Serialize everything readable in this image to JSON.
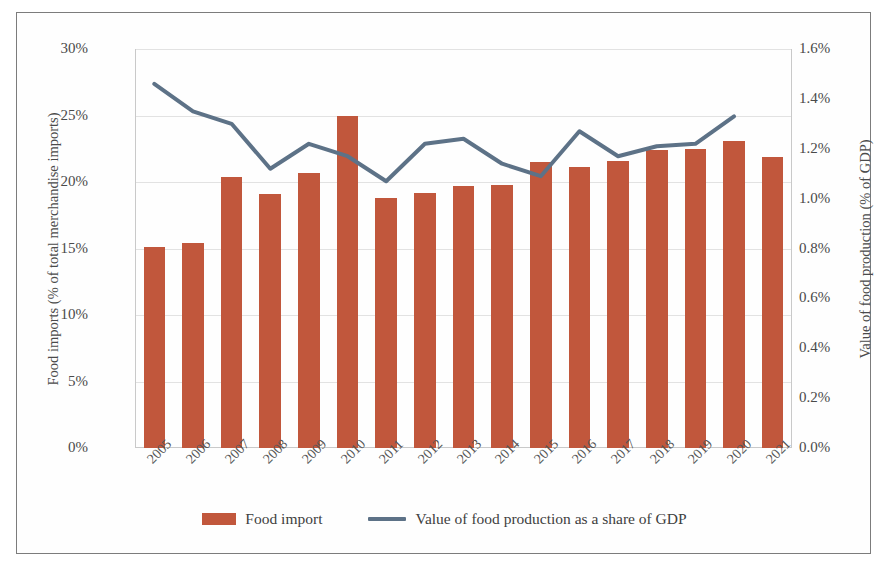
{
  "chart_data": {
    "type": "bar",
    "title": "",
    "xlabel": "",
    "categories": [
      "2005",
      "2006",
      "2007",
      "2008",
      "2009",
      "2010",
      "2011",
      "2012",
      "2013",
      "2014",
      "2015",
      "2016",
      "2017",
      "2018",
      "2019",
      "2020",
      "2021"
    ],
    "grid": true,
    "legend_position": "bottom",
    "series": [
      {
        "name": "Food import",
        "chart_type": "bar",
        "axis": "left",
        "color": "#c1573c",
        "unit": "%",
        "values": [
          15.1,
          15.4,
          20.4,
          19.1,
          20.7,
          25.0,
          18.8,
          19.2,
          19.7,
          19.8,
          21.5,
          21.1,
          21.6,
          22.4,
          22.5,
          23.1,
          21.9
        ]
      },
      {
        "name": "Value of food production as a share of GDP",
        "chart_type": "line",
        "axis": "right",
        "color": "#5d7287",
        "unit": "%",
        "values": [
          1.46,
          1.35,
          1.3,
          1.12,
          1.22,
          1.17,
          1.07,
          1.22,
          1.24,
          1.14,
          1.09,
          1.27,
          1.17,
          1.21,
          1.22,
          1.33,
          null
        ]
      }
    ],
    "left_axis": {
      "label": "Food imports (% of total merchandise imports)",
      "ticks": [
        "0%",
        "5%",
        "10%",
        "15%",
        "20%",
        "25%",
        "30%"
      ],
      "min": 0,
      "max": 30,
      "step": 5
    },
    "right_axis": {
      "label": "Value of food production (% of GDP)",
      "ticks": [
        "0.0%",
        "0.2%",
        "0.4%",
        "0.6%",
        "0.8%",
        "1.0%",
        "1.2%",
        "1.4%",
        "1.6%"
      ],
      "min": 0,
      "max": 1.6,
      "step": 0.2
    },
    "legend": [
      {
        "label": "Food import",
        "marker": "square",
        "color": "#c1573c"
      },
      {
        "label": "Value of food production as a share of GDP",
        "marker": "line",
        "color": "#5d7287"
      }
    ]
  }
}
